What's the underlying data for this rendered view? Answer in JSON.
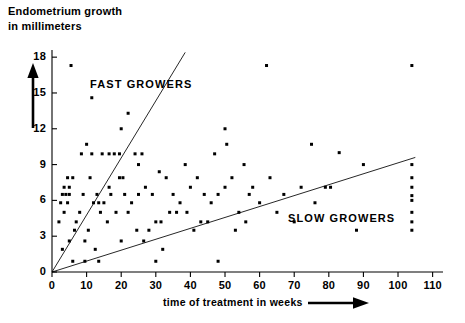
{
  "chart_data": {
    "type": "scatter",
    "title": "",
    "ylabel": "Endometrium growth in millimeters",
    "xlabel": "time of treatment in weeks",
    "ylabel_lines": [
      "Endometrium growth",
      "in millimeters"
    ],
    "xlim": [
      0,
      113
    ],
    "ylim": [
      0,
      18.6
    ],
    "grid": false,
    "legend": "none",
    "xticks": [
      0,
      10,
      20,
      30,
      40,
      50,
      60,
      70,
      80,
      90,
      100,
      110
    ],
    "xtick_labels": [
      "0",
      "10",
      "20",
      "30",
      "40",
      "50",
      "60",
      "70",
      "80",
      "90",
      "100",
      "110"
    ],
    "yticks": [
      0,
      3,
      6,
      9,
      12,
      15,
      18
    ],
    "ytick_labels": [
      "0",
      "3",
      "6",
      "9",
      "12",
      "15",
      "18"
    ],
    "annotations": [
      {
        "text": "FAST GROWERS",
        "x": 15,
        "y": 15.6
      },
      {
        "text": "SLOW GROWERS",
        "x": 68,
        "y": 4.9
      }
    ],
    "reference_lines": [
      {
        "name": "fast-growers-boundary",
        "x0": 0,
        "y0": 0,
        "x1": 38.5,
        "y1": 18.4,
        "slope": 0.478
      },
      {
        "name": "slow-growers-boundary",
        "x0": 0,
        "y0": 0,
        "x1": 105,
        "y1": 9.6,
        "slope": 0.0914
      }
    ],
    "series": [
      {
        "name": "patients",
        "marker": "square",
        "color": "#000000",
        "points": [
          [
            5.5,
            17.3
          ],
          [
            62.0,
            17.3
          ],
          [
            11.5,
            14.6
          ],
          [
            22.0,
            13.3
          ],
          [
            20.0,
            12.0
          ],
          [
            50.0,
            12.0
          ],
          [
            10.0,
            10.7
          ],
          [
            50.5,
            10.7
          ],
          [
            75.0,
            10.7
          ],
          [
            8.5,
            9.9
          ],
          [
            11.5,
            9.9
          ],
          [
            14.5,
            9.9
          ],
          [
            16.5,
            9.9
          ],
          [
            18.0,
            9.9
          ],
          [
            19.5,
            9.9
          ],
          [
            24.0,
            9.9
          ],
          [
            26.0,
            9.9
          ],
          [
            47.0,
            9.9
          ],
          [
            25.0,
            9.0
          ],
          [
            38.5,
            9.0
          ],
          [
            55.5,
            9.0
          ],
          [
            90.0,
            9.0
          ],
          [
            31.0,
            8.4
          ],
          [
            4.5,
            7.9
          ],
          [
            6.0,
            7.9
          ],
          [
            11.0,
            7.9
          ],
          [
            19.5,
            7.9
          ],
          [
            20.5,
            7.9
          ],
          [
            33.0,
            7.9
          ],
          [
            42.0,
            7.9
          ],
          [
            52.0,
            7.9
          ],
          [
            63.0,
            7.9
          ],
          [
            3.5,
            7.1
          ],
          [
            5.0,
            7.1
          ],
          [
            16.5,
            7.1
          ],
          [
            27.0,
            7.1
          ],
          [
            40.0,
            7.1
          ],
          [
            50.0,
            7.1
          ],
          [
            58.0,
            7.1
          ],
          [
            72.0,
            7.1
          ],
          [
            79.0,
            7.1
          ],
          [
            80.5,
            7.1
          ],
          [
            3.0,
            6.5
          ],
          [
            4.0,
            6.5
          ],
          [
            5.0,
            6.5
          ],
          [
            9.0,
            6.5
          ],
          [
            13.0,
            6.5
          ],
          [
            17.0,
            6.5
          ],
          [
            21.0,
            6.5
          ],
          [
            25.0,
            6.5
          ],
          [
            29.0,
            6.5
          ],
          [
            35.0,
            6.5
          ],
          [
            44.0,
            6.5
          ],
          [
            48.0,
            6.5
          ],
          [
            57.0,
            6.5
          ],
          [
            67.0,
            6.5
          ],
          [
            2.5,
            5.8
          ],
          [
            4.5,
            5.8
          ],
          [
            12.0,
            5.8
          ],
          [
            13.5,
            5.8
          ],
          [
            15.0,
            5.8
          ],
          [
            23.0,
            5.8
          ],
          [
            37.0,
            5.8
          ],
          [
            46.0,
            5.8
          ],
          [
            60.0,
            5.8
          ],
          [
            76.0,
            5.8
          ],
          [
            3.5,
            5.0
          ],
          [
            8.0,
            5.0
          ],
          [
            14.0,
            5.0
          ],
          [
            18.5,
            5.0
          ],
          [
            22.0,
            5.0
          ],
          [
            34.0,
            5.0
          ],
          [
            36.0,
            5.0
          ],
          [
            39.0,
            5.0
          ],
          [
            54.0,
            5.0
          ],
          [
            65.0,
            5.0
          ],
          [
            2.0,
            4.2
          ],
          [
            7.0,
            4.2
          ],
          [
            16.0,
            4.2
          ],
          [
            30.0,
            4.2
          ],
          [
            31.5,
            4.2
          ],
          [
            43.0,
            4.2
          ],
          [
            45.0,
            4.2
          ],
          [
            56.0,
            4.2
          ],
          [
            70.0,
            4.2
          ],
          [
            6.5,
            3.5
          ],
          [
            10.5,
            3.5
          ],
          [
            24.5,
            3.5
          ],
          [
            28.0,
            3.5
          ],
          [
            41.0,
            3.5
          ],
          [
            53.0,
            3.5
          ],
          [
            88.0,
            3.5
          ],
          [
            5.0,
            2.6
          ],
          [
            9.5,
            2.6
          ],
          [
            20.0,
            2.6
          ],
          [
            26.5,
            2.6
          ],
          [
            3.0,
            1.9
          ],
          [
            12.5,
            1.9
          ],
          [
            32.0,
            1.9
          ],
          [
            6.0,
            0.9
          ],
          [
            9.5,
            0.9
          ],
          [
            13.5,
            0.9
          ],
          [
            30.0,
            0.9
          ],
          [
            48.0,
            0.9
          ],
          [
            104.0,
            9.0
          ],
          [
            104.0,
            7.9
          ],
          [
            104.0,
            7.1
          ],
          [
            104.0,
            6.4
          ],
          [
            104.0,
            6.0
          ],
          [
            104.0,
            5.0
          ],
          [
            104.0,
            4.2
          ],
          [
            104.0,
            3.5
          ],
          [
            104.0,
            17.3
          ],
          [
            83.0,
            10.0
          ]
        ]
      }
    ]
  },
  "axis_arrows": {
    "y_arrow_name": "y-axis-direction-arrow",
    "x_arrow_name": "x-axis-direction-arrow"
  }
}
